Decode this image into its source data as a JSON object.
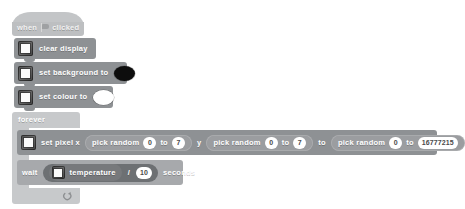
{
  "workspace": {
    "background_color": "#ffffff"
  },
  "script": {
    "hat": {
      "prefix": "when",
      "icon": "green-flag-icon",
      "suffix": "clicked"
    },
    "commands": [
      {
        "id": "clear-display",
        "icon": "microbit-device-icon",
        "label": "clear display"
      },
      {
        "id": "set-background",
        "icon": "microbit-device-icon",
        "label": "set background to",
        "swatch_color": "#0d0d0d"
      },
      {
        "id": "set-colour",
        "icon": "microbit-device-icon",
        "label": "set colour to",
        "swatch_color": "#ffffff"
      }
    ],
    "loop": {
      "label": "forever",
      "loop_icon": "loop-arrow-icon",
      "body": {
        "set_pixel": {
          "icon": "microbit-device-icon",
          "label": "set pixel x",
          "x_random": {
            "label": "pick random",
            "from": "0",
            "to_word": "to",
            "to": "7"
          },
          "y_word": "y",
          "y_random": {
            "label": "pick random",
            "from": "0",
            "to_word": "to",
            "to": "7"
          },
          "colour_word": "to",
          "colour_random": {
            "label": "pick random",
            "from": "0",
            "to_word": "to",
            "to": "16777215"
          }
        },
        "wait": {
          "label": "wait",
          "operand_left": {
            "icon": "microbit-device-icon",
            "label": "temperature"
          },
          "operator": "/",
          "operand_right": "10",
          "suffix": "seconds"
        }
      }
    }
  },
  "colors": {
    "hat_block": "#c3c5c7",
    "command_block": "#8e9194",
    "loop_block": "#c7c9cb",
    "reporter_block": "#9b9da0",
    "operator_block": "#6d7073",
    "sensor_block": "#77797c",
    "value_field": "#ffffff",
    "label_text": "#ffffff"
  }
}
